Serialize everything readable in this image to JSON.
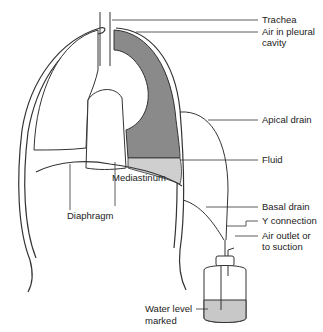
{
  "diagram": {
    "labels": {
      "trachea": "Trachea",
      "air_pleural_1": "Air in pleural",
      "air_pleural_2": "cavity",
      "apical_drain": "Apical drain",
      "fluid": "Fluid",
      "mediastinum": "Mediastinum",
      "diaphragm": "Diaphragm",
      "basal_drain": "Basal drain",
      "y_connection": "Y connection",
      "air_outlet_1": "Air outlet or",
      "air_outlet_2": "to suction",
      "water_level_1": "Water level",
      "water_level_2": "marked"
    },
    "colors": {
      "outline": "#333333",
      "collapsed_lung_shade": "#8a8a8a",
      "fluid_shade": "#cfcfcf",
      "water_shade": "#c8c8c8"
    }
  }
}
